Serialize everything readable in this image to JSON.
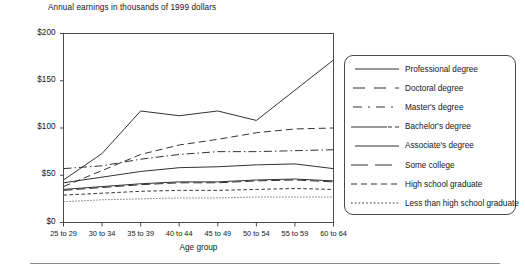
{
  "chart_data": {
    "type": "line",
    "title": "Annual earnings in thousands of 1999 dollars",
    "xlabel": "Age group",
    "ylabel": "",
    "grid": false,
    "legend_position": "right",
    "ylim": [
      0,
      200
    ],
    "ytick_labels": [
      "$0",
      "$50",
      "$100",
      "$150",
      "$200"
    ],
    "ytick_values": [
      0,
      50,
      100,
      150,
      200
    ],
    "categories": [
      "25 to 29",
      "30 to 34",
      "35 to 39",
      "40 to 44",
      "45 to 49",
      "50 to 54",
      "55 to 59",
      "60 to 64"
    ],
    "series": [
      {
        "name": "Professional degree",
        "line_style": "solid",
        "values": [
          45,
          73,
          118,
          113,
          118,
          108,
          140,
          172
        ]
      },
      {
        "name": "Doctoral degree",
        "line_style": "dashed",
        "values": [
          38,
          55,
          72,
          82,
          88,
          95,
          99,
          100
        ]
      },
      {
        "name": "Master's degree",
        "line_style": "dash-dot",
        "values": [
          57,
          60,
          67,
          72,
          75,
          75,
          76,
          77
        ]
      },
      {
        "name": "Bachelor's degree",
        "line_style": "solid-dash",
        "values": [
          42,
          48,
          54,
          58,
          59,
          61,
          62,
          57
        ]
      },
      {
        "name": "Associate's degree",
        "line_style": "solid",
        "values": [
          35,
          38,
          41,
          43,
          43,
          45,
          46,
          44
        ]
      },
      {
        "name": "Some college",
        "line_style": "long-dash",
        "values": [
          34,
          37,
          40,
          42,
          42,
          44,
          45,
          43
        ]
      },
      {
        "name": "High school graduate",
        "line_style": "short-dash",
        "values": [
          29,
          31,
          33,
          34,
          34,
          35,
          36,
          35
        ]
      },
      {
        "name": "Less than high school graduate",
        "line_style": "dotted",
        "values": [
          22,
          24,
          25,
          26,
          26,
          27,
          27,
          27
        ]
      }
    ]
  },
  "legend": {
    "items": [
      {
        "label": "Professional degree"
      },
      {
        "label": "Doctoral degree"
      },
      {
        "label": "Master's degree"
      },
      {
        "label": "Bachelor's degree"
      },
      {
        "label": "Associate's degree"
      },
      {
        "label": "Some college"
      },
      {
        "label": "High school graduate"
      },
      {
        "label": "Less than high school graduate"
      }
    ]
  },
  "colors": {
    "line": "#333333",
    "axis": "#4a4a4a",
    "text": "#151515"
  }
}
